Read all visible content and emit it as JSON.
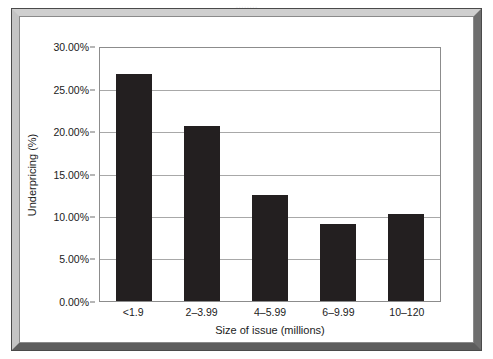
{
  "page_bleed_text": "........",
  "chart_data": {
    "type": "bar",
    "title": "",
    "categories": [
      "<1.9",
      "2–3.99",
      "4–5.99",
      "6–9.99",
      "10–120"
    ],
    "values": [
      26.9,
      20.7,
      12.6,
      9.1,
      10.3
    ],
    "xlabel": "Size of issue (millions)",
    "ylabel": "Underpricing (%)",
    "ylim": [
      0,
      30
    ],
    "ytick_step": 5,
    "ytick_labels": [
      "30.00%",
      "25.00%",
      "20.00%",
      "15.00%",
      "10.00%",
      "5.00%",
      "0.00%"
    ],
    "ytick_values": [
      30,
      25,
      20,
      15,
      10,
      5,
      0
    ],
    "grid": true,
    "legend": false,
    "bar_color": "#231f20",
    "plot_background": "#ffffff",
    "gridline_color": "#a8a8a8",
    "axis_color": "#8c8c8c",
    "frame_color": "#6e6e6e"
  }
}
